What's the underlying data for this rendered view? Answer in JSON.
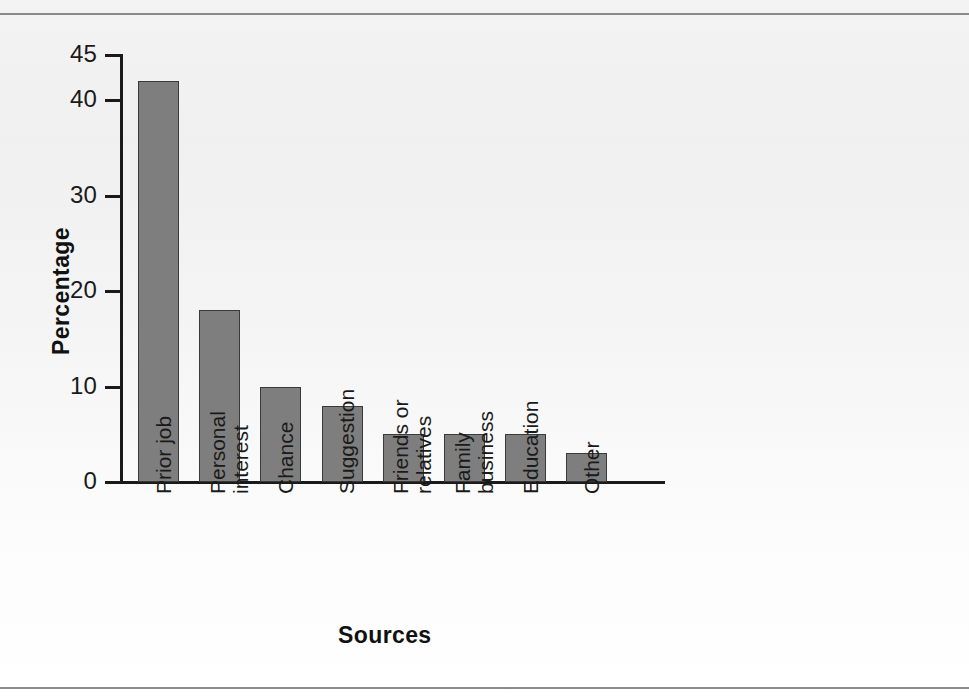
{
  "chart_data": {
    "type": "bar",
    "title": "",
    "xlabel": "Sources",
    "ylabel": "Percentage",
    "categories": [
      "Prior job",
      "Personal interest",
      "Chance",
      "Suggestion",
      "Friends or relatives",
      "Family business",
      "Education",
      "Other"
    ],
    "category_lines": [
      [
        "Prior job"
      ],
      [
        "Personal",
        "interest"
      ],
      [
        "Chance"
      ],
      [
        "Suggestion"
      ],
      [
        "Friends or",
        "relatives"
      ],
      [
        "Family",
        "business"
      ],
      [
        "Education"
      ],
      [
        "Other"
      ]
    ],
    "values": [
      42,
      18,
      10,
      8,
      5,
      5,
      5,
      3
    ],
    "ylim": [
      0,
      45
    ],
    "yticks": [
      0,
      10,
      20,
      30,
      40,
      45
    ],
    "ytick_labels": [
      "0",
      "10",
      "20",
      "30",
      "40",
      "45"
    ],
    "grid": false,
    "legend": null,
    "bar_color": "#7e7e7e",
    "bar_edge_color": "#3a3a3a",
    "axis_color": "#1a1a1a",
    "background_color": "#f2f2f2"
  }
}
